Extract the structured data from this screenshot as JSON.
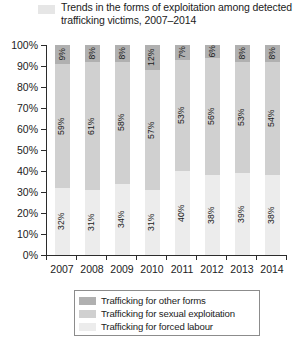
{
  "title": {
    "text": "Trends in the forms of exploitation among detected trafficking victims, 2007–2014",
    "swatch_color": "#e6e6e6"
  },
  "colors": {
    "other_forms": "#b0b0b0",
    "sexual_exploitation": "#d0d0d0",
    "forced_labour": "#ececec",
    "axis": "#2b2b2b",
    "text": "#1b1b1b"
  },
  "legend": {
    "items": [
      {
        "label": "Trafficking for other forms",
        "color": "#b0b0b0",
        "key": "other_forms"
      },
      {
        "label": "Trafficking for sexual exploitation",
        "color": "#d0d0d0",
        "key": "sexual_exploitation"
      },
      {
        "label": "Trafficking for forced labour",
        "color": "#ececec",
        "key": "forced_labour"
      }
    ]
  },
  "yaxis": {
    "ticks": [
      "0%",
      "10%",
      "20%",
      "30%",
      "40%",
      "50%",
      "60%",
      "70%",
      "80%",
      "90%",
      "100%"
    ],
    "min": 0,
    "max": 100
  },
  "chart_data": {
    "type": "bar",
    "subtype": "stacked-column-100",
    "title": "Trends in the forms of exploitation among detected trafficking victims, 2007–2014",
    "xlabel": "",
    "ylabel": "",
    "ylim": [
      0,
      100
    ],
    "ytick_labels": [
      "0%",
      "10%",
      "20%",
      "30%",
      "40%",
      "50%",
      "60%",
      "70%",
      "80%",
      "90%",
      "100%"
    ],
    "grid": false,
    "legend_position": "bottom",
    "categories": [
      "2007",
      "2008",
      "2009",
      "2010",
      "2011",
      "2012",
      "2013",
      "2014"
    ],
    "series": [
      {
        "name": "Trafficking for other forms",
        "color": "#b0b0b0",
        "values": [
          9,
          8,
          8,
          12,
          7,
          6,
          8,
          8
        ],
        "labels": [
          "9%",
          "8%",
          "8%",
          "12%",
          "7%",
          "6%",
          "8%",
          "8%"
        ]
      },
      {
        "name": "Trafficking for sexual exploitation",
        "color": "#d0d0d0",
        "values": [
          59,
          61,
          58,
          57,
          53,
          56,
          53,
          54
        ],
        "labels": [
          "59%",
          "61%",
          "58%",
          "57%",
          "53%",
          "56%",
          "53%",
          "54%"
        ]
      },
      {
        "name": "Trafficking for forced labour",
        "color": "#ececec",
        "values": [
          32,
          31,
          34,
          31,
          40,
          38,
          39,
          38
        ],
        "labels": [
          "32%",
          "31%",
          "34%",
          "31%",
          "40%",
          "38%",
          "39%",
          "38%"
        ]
      }
    ]
  }
}
